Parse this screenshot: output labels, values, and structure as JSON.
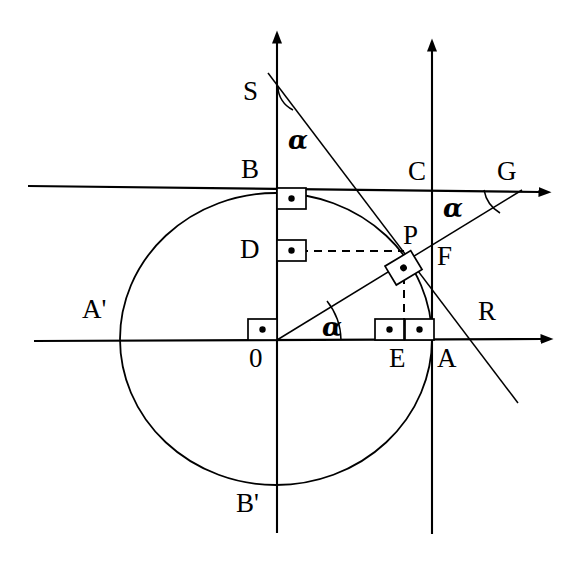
{
  "figure": {
    "kind": "geometry-diagram",
    "background_color": "#ffffff",
    "stroke_color": "#000000",
    "canvas": {
      "width": 579,
      "height": 563
    }
  },
  "geometry": {
    "origin": {
      "x": 276,
      "y": 340
    },
    "circle": {
      "cx": 276,
      "cy": 339,
      "rx": 156,
      "ry": 146
    },
    "angle_deg": 42
  },
  "labels": {
    "origin": "0",
    "point_a": "A",
    "point_a_prime": "A'",
    "point_b": "B",
    "point_b_prime": "B'",
    "point_c": "C",
    "point_d": "D",
    "point_e": "E",
    "point_f": "F",
    "point_g": "G",
    "point_p": "P",
    "point_r": "R",
    "point_s": "S",
    "angle_at_origin": "α",
    "angle_at_s": "α",
    "angle_at_g": "α"
  },
  "markers": {
    "right_angle_count": 6,
    "right_angle_symbol": "∙",
    "dashed_segments": [
      "D–P",
      "P–E"
    ]
  },
  "lines": {
    "x_axis": "horizontal axis through 0 with arrow head at right",
    "y_axis": "vertical axis through 0 with arrow head at top",
    "tangent_top": "horizontal tangent line through B and C with arrow head at right",
    "tangent_right": "vertical tangent line through C, F and A with arrow head at top",
    "ray_og": "ray from 0 through P to G",
    "line_sr": "tangent line at P through S and R"
  }
}
